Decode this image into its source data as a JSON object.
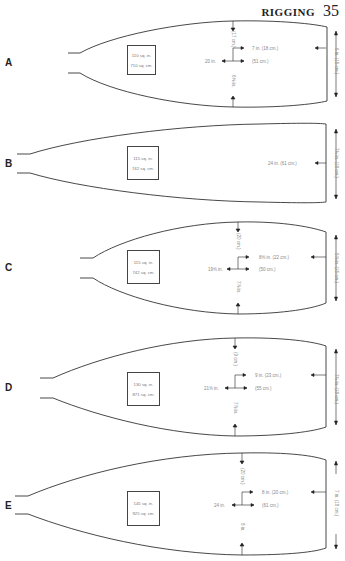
{
  "header": {
    "title": "RIGGING",
    "page": "35"
  },
  "blades": [
    {
      "letter": "A",
      "area_in": "110 sq. in.",
      "area_cm": "710 sq. cm.",
      "top_offset": "(17 cm.)",
      "width_label": "7 in. (18 cm.)",
      "length_in": "20 in.",
      "length_cm": "(51 cm.)",
      "bottom_offset": "6⅝ in.",
      "tip_height": "6 in. (15 cm.)"
    },
    {
      "letter": "B",
      "area_in": "115 sq. in.",
      "area_cm": "742 sq. cm.",
      "length_label": "24 in. (61 cm.)",
      "tip_height": "7¼ in. (18 cm.)"
    },
    {
      "letter": "C",
      "area_in": "115 sq. in.",
      "area_cm": "742 sq. cm.",
      "top_offset": "(20 cm.)",
      "width_label": "8⅝ in. (22 cm.)",
      "length_in": "19⅝ in.",
      "length_cm": "(50 cm.)",
      "bottom_offset": "7⅞ in.",
      "tip_height": "5⅞ in. (15 cm.)"
    },
    {
      "letter": "D",
      "area_in": "130 sq. in.",
      "area_cm": "871 sq. cm.",
      "top_offset": "(9 cm.)",
      "width_label": "9 in. (23 cm.)",
      "length_in": "21⅝ in.",
      "length_cm": "(55 cm.)",
      "bottom_offset": "7⅞ in.",
      "tip_height": "7¼ in. (18 cm.)"
    },
    {
      "letter": "E",
      "area_in": "145 sq. in.",
      "area_cm": "925 sq. cm.",
      "top_offset": "(20 cm.)",
      "width_label": "8 in. (20 cm.)",
      "length_in": "24 in.",
      "length_cm": "(61 cm.)",
      "bottom_offset": "8 in.",
      "tip_height": "7 in. (18 cm.)"
    }
  ]
}
